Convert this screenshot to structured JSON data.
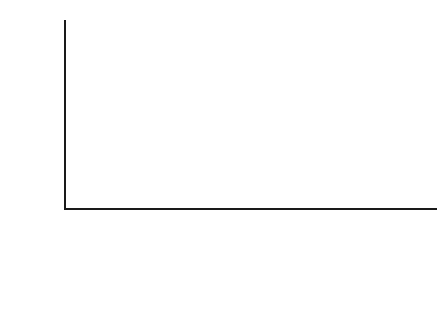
{
  "chart_data": {
    "type": "bar",
    "title": "",
    "subtitle": "",
    "xlabel": "",
    "ylabel": "% mortality",
    "ylim": [
      0,
      100
    ],
    "yticks": [
      0,
      10,
      20,
      30,
      40,
      50,
      60,
      70,
      80,
      90,
      100
    ],
    "grid": false,
    "legend": "none",
    "bar_color": "#7a7a7a",
    "axis_color": "#1a1a1a",
    "categories": [
      "> 40% BSB",
      "inhalation\ninjury",
      "> 60% yr",
      "> 40% BSB\n+\ninhalation\ninjury",
      "> 60% yr\n+\ninhalation\ninjury",
      "> 40% BSB\n+\n> 60% yr\n+\ninhalation\ninjury"
    ],
    "values": [
      3,
      4,
      5,
      27,
      39,
      95
    ],
    "value_labels": [
      "3",
      "4",
      "5",
      "27",
      "39",
      "95"
    ],
    "ytick_labels": [
      "0",
      "10",
      "20",
      "30",
      "40",
      "50",
      "60",
      "70",
      "80",
      "90",
      "100"
    ]
  }
}
